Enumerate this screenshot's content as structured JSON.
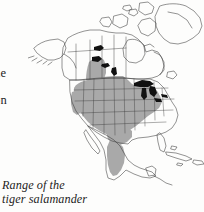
{
  "figure": {
    "caption_line_1": "Range of the",
    "caption_line_2": "tiger salamander",
    "subject": "tiger salamander",
    "map_region": "North America",
    "projection_note": "continental outline with state and province boundaries"
  },
  "body_text_fragments": {
    "fragment_1": "he",
    "fragment_2": "on"
  },
  "legend": {
    "range_shading_label": "Range of the tiger salamander",
    "range_fill_color": "#a9a9a9",
    "water_fill_color": "#111111",
    "outline_color": "#3a3a3a",
    "background_color": "#fdfdfc"
  },
  "map_features": {
    "shaded_range_areas": [
      "Great Plains",
      "Midwestern United States",
      "Rocky Mountain states",
      "Great Lakes states",
      "Texas",
      "Central Mexican highlands",
      "southern Canadian prairies"
    ],
    "black_water_bodies": [
      "Great Bear Lake",
      "Great Slave Lake",
      "Lake Athabasca",
      "Lake Winnipeg",
      "Lake Superior",
      "Lake Michigan",
      "Lake Huron",
      "Lake Erie",
      "Lake Ontario"
    ],
    "landmasses": [
      "Alaska",
      "Canada",
      "Greenland",
      "United States",
      "Mexico",
      "Cuba",
      "Hispaniola",
      "Central America"
    ]
  }
}
